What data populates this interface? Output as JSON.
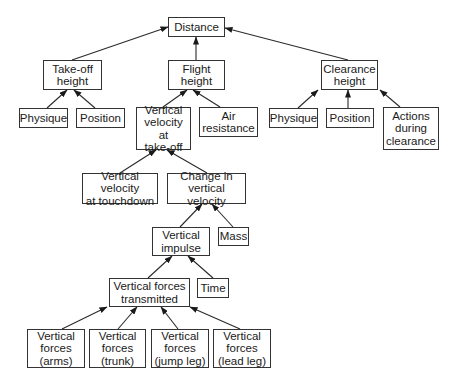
{
  "diagram": {
    "type": "hierarchical-model",
    "colors": {
      "line": "#2a2a2a",
      "box_border": "#333333",
      "text": "#1a1a1a",
      "background": "#ffffff"
    },
    "nodes": [
      {
        "id": "distance",
        "label": "Distance",
        "x": 168,
        "y": 17,
        "w": 57,
        "h": 20
      },
      {
        "id": "takeoff_height",
        "label": "Take-off\nheight",
        "x": 43,
        "y": 60,
        "w": 59,
        "h": 30
      },
      {
        "id": "flight_height",
        "label": "Flight\nheight",
        "x": 168,
        "y": 60,
        "w": 57,
        "h": 30
      },
      {
        "id": "clearance_height",
        "label": "Clearance\nheight",
        "x": 321,
        "y": 60,
        "w": 57,
        "h": 30
      },
      {
        "id": "physique_left",
        "label": "Physique",
        "x": 19,
        "y": 108,
        "w": 49,
        "h": 20
      },
      {
        "id": "position_left",
        "label": "Position",
        "x": 76,
        "y": 108,
        "w": 49,
        "h": 20
      },
      {
        "id": "vertical_velocity_takeoff",
        "label": "Vertical\nvelocity at\ntake-off",
        "x": 136,
        "y": 107,
        "w": 55,
        "h": 43
      },
      {
        "id": "air_resistance",
        "label": "Air\nresistance",
        "x": 199,
        "y": 107,
        "w": 59,
        "h": 30
      },
      {
        "id": "physique_right",
        "label": "Physique",
        "x": 269,
        "y": 108,
        "w": 49,
        "h": 20
      },
      {
        "id": "position_right",
        "label": "Position",
        "x": 326,
        "y": 108,
        "w": 48,
        "h": 20
      },
      {
        "id": "actions_during_clearance",
        "label": "Actions\nduring\nclearance",
        "x": 383,
        "y": 107,
        "w": 56,
        "h": 43
      },
      {
        "id": "vertical_velocity_touchdown",
        "label": "Vertical velocity\nat touchdown",
        "x": 82,
        "y": 173,
        "w": 76,
        "h": 31
      },
      {
        "id": "change_vertical_velocity",
        "label": "Change in\nvertical velocity",
        "x": 167,
        "y": 173,
        "w": 79,
        "h": 31
      },
      {
        "id": "vertical_impulse",
        "label": "Vertical\nimpulse",
        "x": 152,
        "y": 227,
        "w": 58,
        "h": 29
      },
      {
        "id": "mass",
        "label": "Mass",
        "x": 218,
        "y": 227,
        "w": 31,
        "h": 19
      },
      {
        "id": "vertical_forces_transmitted",
        "label": "Vertical forces\ntransmitted",
        "x": 109,
        "y": 278,
        "w": 81,
        "h": 29
      },
      {
        "id": "time",
        "label": "Time",
        "x": 197,
        "y": 278,
        "w": 32,
        "h": 20
      },
      {
        "id": "vertical_forces_arms",
        "label": "Vertical\nforces\n(arms)",
        "x": 27,
        "y": 329,
        "w": 58,
        "h": 39
      },
      {
        "id": "vertical_forces_trunk",
        "label": "Vertical\nforces\n(trunk)",
        "x": 89,
        "y": 329,
        "w": 57,
        "h": 39
      },
      {
        "id": "vertical_forces_jump_leg",
        "label": "Vertical\nforces\n(jump leg)",
        "x": 151,
        "y": 329,
        "w": 58,
        "h": 39
      },
      {
        "id": "vertical_forces_lead_leg",
        "label": "Vertical\nforces\n(lead leg)",
        "x": 213,
        "y": 329,
        "w": 58,
        "h": 39
      }
    ],
    "edges": [
      {
        "from": "takeoff_height",
        "to": "distance",
        "x1": 72,
        "y1": 60,
        "x2": 168,
        "y2": 27
      },
      {
        "from": "flight_height",
        "to": "distance",
        "x1": 196,
        "y1": 60,
        "x2": 196,
        "y2": 37
      },
      {
        "from": "clearance_height",
        "to": "distance",
        "x1": 348,
        "y1": 60,
        "x2": 225,
        "y2": 28
      },
      {
        "from": "physique_left",
        "to": "takeoff_height",
        "x1": 47,
        "y1": 108,
        "x2": 67,
        "y2": 90
      },
      {
        "from": "position_left",
        "to": "takeoff_height",
        "x1": 95,
        "y1": 108,
        "x2": 74,
        "y2": 90
      },
      {
        "from": "vertical_velocity_takeoff",
        "to": "flight_height",
        "x1": 163,
        "y1": 107,
        "x2": 187,
        "y2": 90
      },
      {
        "from": "air_resistance",
        "to": "flight_height",
        "x1": 220,
        "y1": 107,
        "x2": 193,
        "y2": 90
      },
      {
        "from": "physique_right",
        "to": "clearance_height",
        "x1": 298,
        "y1": 108,
        "x2": 318,
        "y2": 90
      },
      {
        "from": "position_right",
        "to": "clearance_height",
        "x1": 348,
        "y1": 108,
        "x2": 348,
        "y2": 90
      },
      {
        "from": "actions_during_clearance",
        "to": "clearance_height",
        "x1": 400,
        "y1": 107,
        "x2": 380,
        "y2": 90
      },
      {
        "from": "vertical_velocity_touchdown",
        "to": "vertical_velocity_takeoff",
        "x1": 120,
        "y1": 173,
        "x2": 156,
        "y2": 150
      },
      {
        "from": "change_vertical_velocity",
        "to": "vertical_velocity_takeoff",
        "x1": 207,
        "y1": 173,
        "x2": 167,
        "y2": 150
      },
      {
        "from": "vertical_impulse",
        "to": "change_vertical_velocity",
        "x1": 180,
        "y1": 227,
        "x2": 202,
        "y2": 204
      },
      {
        "from": "mass",
        "to": "change_vertical_velocity",
        "x1": 233,
        "y1": 227,
        "x2": 212,
        "y2": 204
      },
      {
        "from": "vertical_forces_transmitted",
        "to": "vertical_impulse",
        "x1": 148,
        "y1": 278,
        "x2": 172,
        "y2": 256
      },
      {
        "from": "time",
        "to": "vertical_impulse",
        "x1": 213,
        "y1": 278,
        "x2": 188,
        "y2": 256
      },
      {
        "from": "vertical_forces_arms",
        "to": "vertical_forces_transmitted",
        "x1": 62,
        "y1": 329,
        "x2": 107,
        "y2": 307
      },
      {
        "from": "vertical_forces_trunk",
        "to": "vertical_forces_transmitted",
        "x1": 118,
        "y1": 329,
        "x2": 137,
        "y2": 307
      },
      {
        "from": "vertical_forces_jump_leg",
        "to": "vertical_forces_transmitted",
        "x1": 178,
        "y1": 329,
        "x2": 161,
        "y2": 307
      },
      {
        "from": "vertical_forces_lead_leg",
        "to": "vertical_forces_transmitted",
        "x1": 240,
        "y1": 329,
        "x2": 190,
        "y2": 307
      }
    ]
  }
}
